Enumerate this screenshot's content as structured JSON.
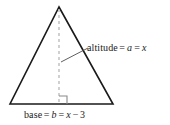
{
  "figure": {
    "background_color": "#ffffff",
    "stroke_color": "#1a1a1a",
    "dash_color": "#b8b8b8",
    "leader_color": "#4d4d4d",
    "text_color": "#1a1a1a"
  },
  "labels": {
    "altitude": {
      "name": "altitude",
      "eq1": "=",
      "symbol": "a",
      "eq2": "=",
      "value": "x",
      "full_text": "altitude = a = x"
    },
    "base": {
      "name": "base",
      "eq1": "=",
      "symbol": "b",
      "eq2": "=",
      "value": "x",
      "minus": "−",
      "constant": "3",
      "full_text": "base = b = x − 3"
    }
  },
  "geometry": {
    "apex": {
      "x": 59,
      "y": 7
    },
    "base_left": {
      "x": 10,
      "y": 104
    },
    "base_right": {
      "x": 113,
      "y": 104
    },
    "altitude_foot": {
      "x": 59,
      "y": 104
    },
    "right_angle_marker_size": 8,
    "leader_start": {
      "x": 61,
      "y": 62
    },
    "leader_end": {
      "x": 88,
      "y": 48
    }
  }
}
